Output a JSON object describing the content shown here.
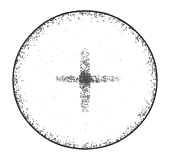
{
  "figure": {
    "title": "Stippled circular aperture with central cross pattern",
    "type": "stipple-diagram",
    "caption": "",
    "background_color": "#ffffff",
    "ink_color": "#2b2b2b",
    "stipple_color": "#4a4a4a",
    "canvas": {
      "width": 170,
      "height": 161
    },
    "circle": {
      "name": "outer-circle",
      "center_x": 85,
      "center_y": 80,
      "radius_x": 72,
      "radius_y": 69,
      "stroke_color": "#232323",
      "stroke_width": 1.3,
      "bounds": {
        "left": 13,
        "right": 157,
        "top": 11,
        "bottom": 149
      }
    },
    "inner_stipple_band": {
      "name": "inner-rim-stipple",
      "inner_radius_fraction": 0.82,
      "outer_radius_fraction": 1.0,
      "dot_count": 1500,
      "dot_min_radius": 0.28,
      "dot_max_radius": 0.75,
      "density_description": "dense speckle hugging the inside of the ring, thinning inward"
    },
    "cross": {
      "name": "central-cross",
      "center_x": 85,
      "center_y": 79,
      "vertical_arm": {
        "name": "cross-vertical-arm",
        "top": 48,
        "bottom": 113,
        "half_width": 5.5,
        "dot_count": 620
      },
      "horizontal_arm": {
        "name": "cross-horizontal-arm",
        "left": 56,
        "right": 120,
        "half_height": 3.6,
        "dot_count": 520
      },
      "dot_min_radius": 0.3,
      "dot_max_radius": 0.8,
      "density_description": "stippled plus sign, densest at the intersection and fading toward the arm tips"
    },
    "interior_noise": {
      "name": "interior-sparse-noise",
      "dot_count": 70,
      "radius_fraction_limit": 0.78
    },
    "random_seed": 20240517
  }
}
